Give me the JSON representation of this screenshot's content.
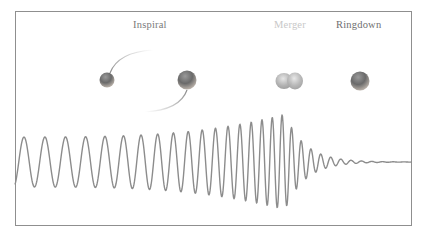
{
  "diagram": {
    "phases": [
      {
        "label": "Inspiral",
        "color": "#7a7a7a"
      },
      {
        "label": "Merger",
        "color": "#c8c8c8"
      },
      {
        "label": "Ringdown",
        "color": "#6f6f6f"
      }
    ],
    "colors": {
      "frame": "#8f8f8f",
      "waveform": "#8c8c8c",
      "orbit": "#9a9a9a",
      "body_dark": "#6e6e6e",
      "body_light": "#bdbdbd"
    },
    "waveform": {
      "description": "Gravitational-wave strain: inspiral chirp with growing amplitude and frequency, peak at merger, exponentially damped ringdown",
      "x_start": 15,
      "x_merger": 285,
      "x_end": 412,
      "baseline_y": 162,
      "inspiral_amplitude": 25,
      "peak_amplitude": 48
    }
  }
}
